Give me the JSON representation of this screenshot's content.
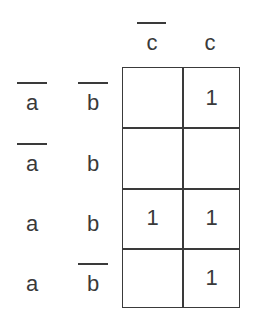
{
  "kmap": {
    "columns": [
      {
        "label": "c",
        "negated": true
      },
      {
        "label": "c",
        "negated": false
      }
    ],
    "rows": [
      {
        "a": {
          "label": "a",
          "negated": true
        },
        "b": {
          "label": "b",
          "negated": true
        },
        "cells": [
          "",
          "1"
        ]
      },
      {
        "a": {
          "label": "a",
          "negated": true
        },
        "b": {
          "label": "b",
          "negated": false
        },
        "cells": [
          "",
          ""
        ]
      },
      {
        "a": {
          "label": "a",
          "negated": false
        },
        "b": {
          "label": "b",
          "negated": false
        },
        "cells": [
          "1",
          "1"
        ]
      },
      {
        "a": {
          "label": "a",
          "negated": false
        },
        "b": {
          "label": "b",
          "negated": true
        },
        "cells": [
          "",
          "1"
        ]
      }
    ]
  }
}
